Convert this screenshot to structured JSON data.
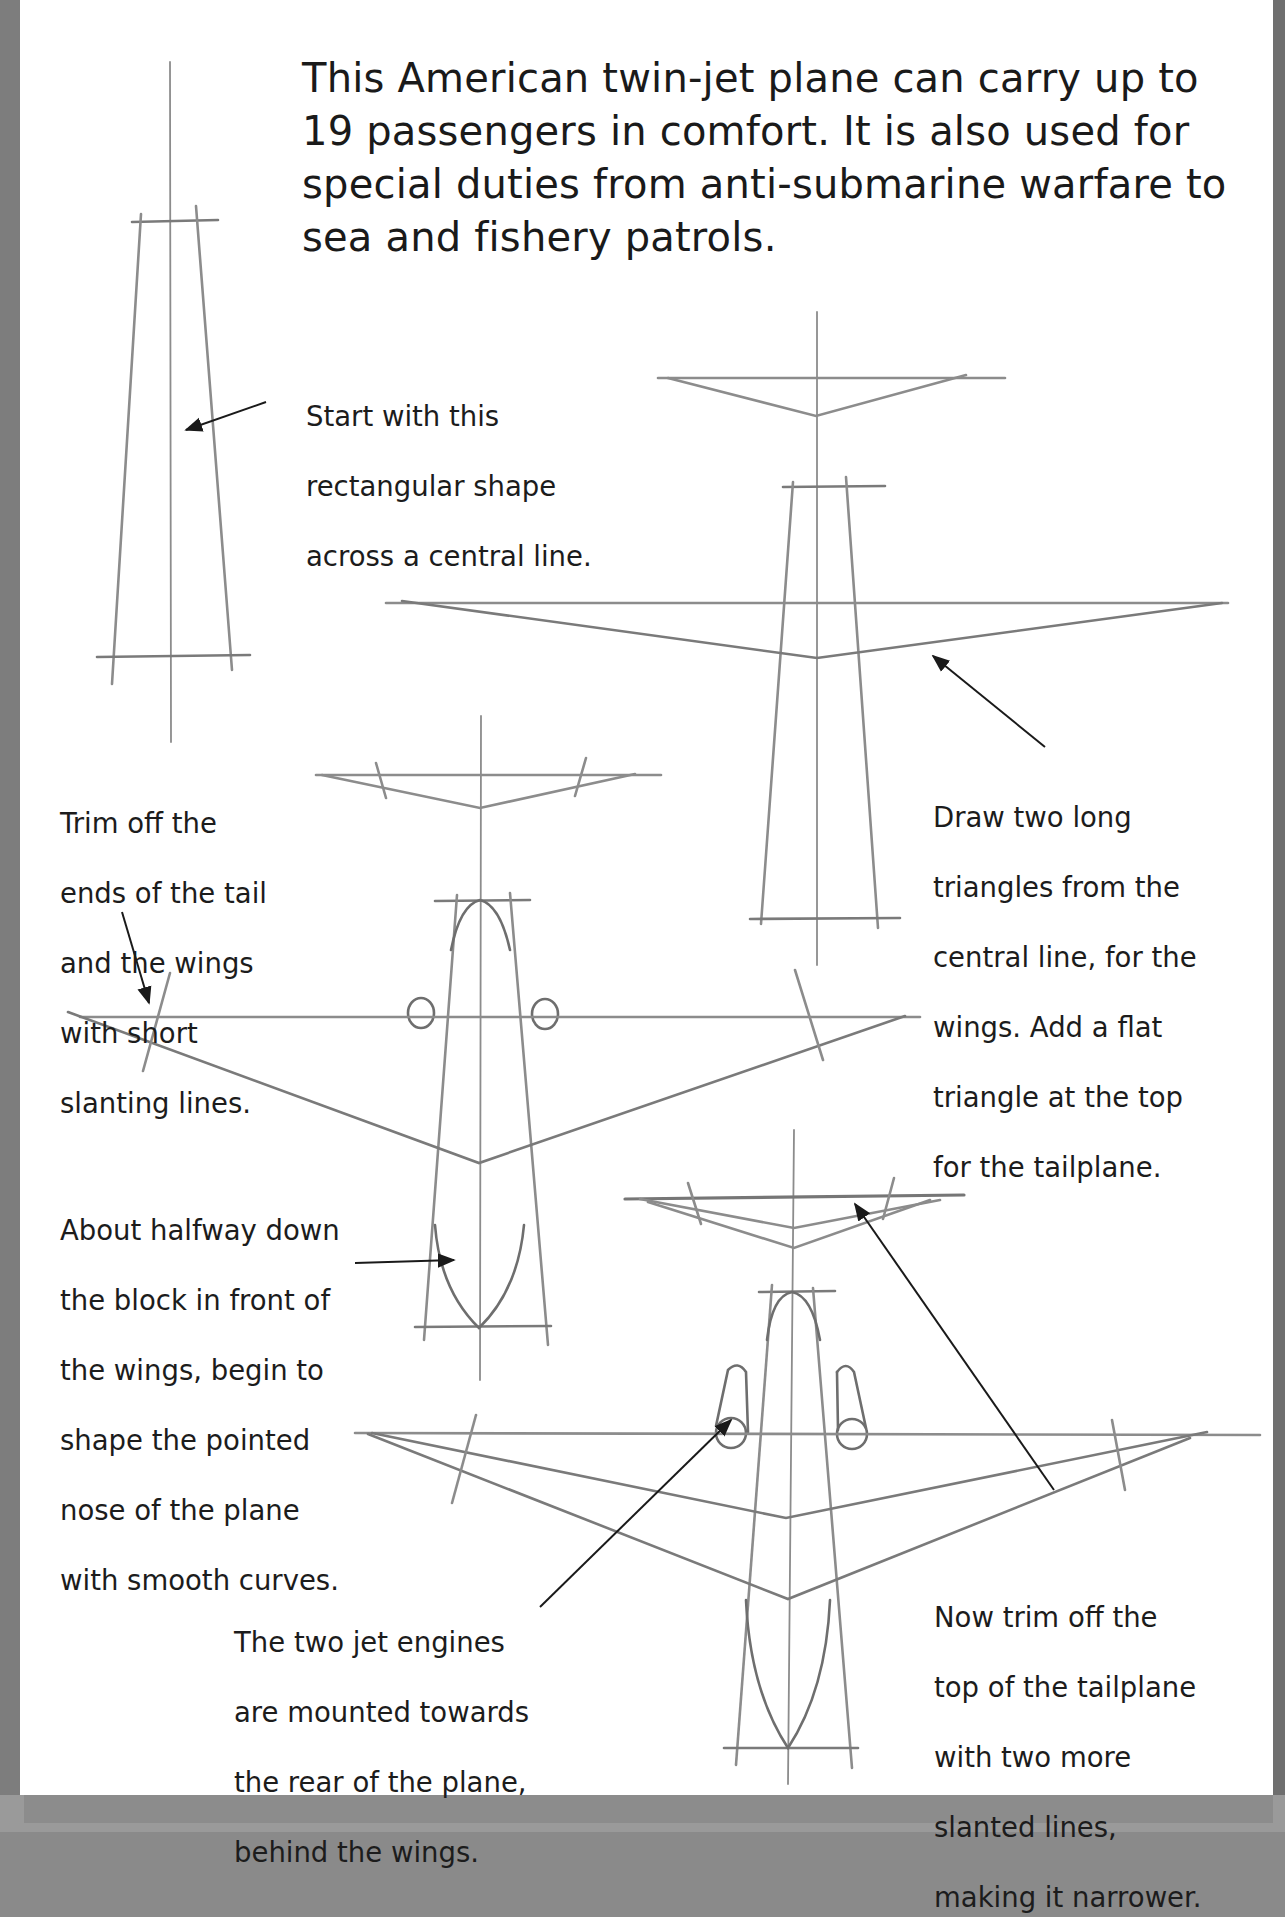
{
  "intro": {
    "lines": [
      "This American twin-jet plane can carry up to",
      "19 passengers in comfort. It is also used for",
      "special duties from anti-submarine warfare to",
      "sea and fishery patrols."
    ]
  },
  "steps": [
    {
      "id": "step-1",
      "caption_lines": [
        "Start with this",
        "rectangular shape",
        "across a central line."
      ]
    },
    {
      "id": "step-2",
      "caption_lines": [
        "Draw two long",
        "triangles from the",
        "central line, for the",
        "wings. Add a flat",
        "triangle at the top",
        "for the tailplane."
      ]
    },
    {
      "id": "step-3",
      "caption_lines": [
        "Trim off the",
        "ends of the tail",
        "and the wings",
        "with short",
        "slanting lines."
      ],
      "caption2_lines": [
        "About halfway down",
        "the block in front of",
        "the wings, begin to",
        "shape the pointed",
        "nose of the plane",
        "with smooth curves."
      ]
    },
    {
      "id": "step-4",
      "caption_lines": [
        "The two jet engines",
        "are mounted towards",
        "the rear of the plane,",
        "behind the wings."
      ],
      "caption2_lines": [
        "Now trim off the",
        "top of the tailplane",
        "with two more",
        "slanted lines,",
        "making it narrower."
      ]
    }
  ],
  "colors": {
    "pencil": "#8c8c8c",
    "pencil_dark": "#6e6e6e",
    "ink": "#1a1a1a",
    "frame": "#7d7d7d",
    "paper": "#ffffff"
  }
}
